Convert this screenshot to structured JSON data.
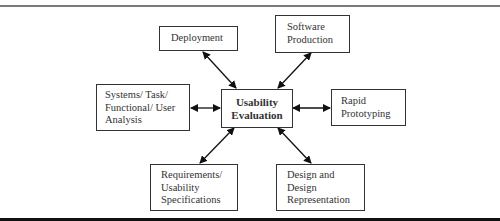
{
  "diagram": {
    "center": {
      "label": "Usability\nEvaluation"
    },
    "nodes": [
      {
        "id": "deployment",
        "label": "Deployment"
      },
      {
        "id": "software-production",
        "label": "Software\nProduction"
      },
      {
        "id": "systems-analysis",
        "label": "Systems/ Task/\nFunctional/ User\nAnalysis"
      },
      {
        "id": "rapid-prototyping",
        "label": "Rapid\nPrototyping"
      },
      {
        "id": "requirements",
        "label": "Requirements/\nUsability\nSpecifications"
      },
      {
        "id": "design",
        "label": "Design and\nDesign\nRepresentation"
      }
    ],
    "edges": [
      {
        "from": "center",
        "to": "deployment",
        "type": "bidirectional"
      },
      {
        "from": "center",
        "to": "software-production",
        "type": "bidirectional"
      },
      {
        "from": "center",
        "to": "systems-analysis",
        "type": "bidirectional"
      },
      {
        "from": "center",
        "to": "rapid-prototyping",
        "type": "bidirectional"
      },
      {
        "from": "center",
        "to": "requirements",
        "type": "bidirectional"
      },
      {
        "from": "center",
        "to": "design",
        "type": "bidirectional"
      }
    ],
    "colors": {
      "stroke": "#333333",
      "background": "#ffffff"
    }
  }
}
